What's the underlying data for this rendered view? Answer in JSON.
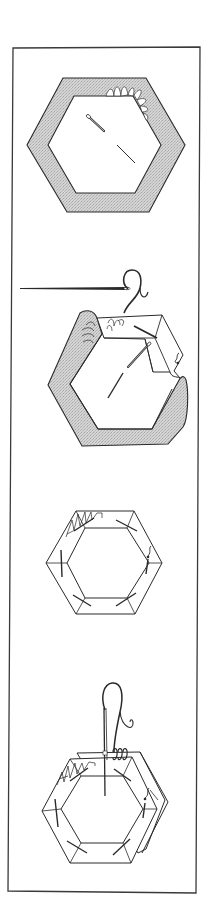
{
  "figure": {
    "description": "English paper piecing instructions: four steps for basting fabric around a hexagon paper template and whip-stitching two hexagons together",
    "colors": {
      "line": "#2a2a2a",
      "fabric_fill": "#d0d0d0",
      "background": "#ffffff",
      "frame": "#3a3a3a"
    },
    "steps": [
      {
        "id": 1,
        "label": "Hexagon paper template pinned to fabric, seam allowance shown shaded"
      },
      {
        "id": 2,
        "label": "Folding fabric over template edge and basting with needle and thread"
      },
      {
        "id": 3,
        "label": "Fabric fully basted around the hexagon template"
      },
      {
        "id": 4,
        "label": "Whip-stitching two basted hexagons together along one edge"
      }
    ]
  }
}
